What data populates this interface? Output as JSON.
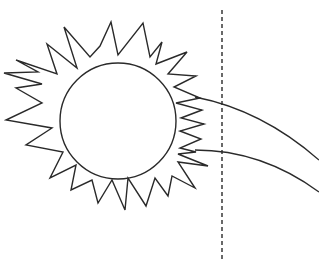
{
  "diagram": {
    "stroke_color": "#2a2a2a",
    "background_color": "#ffffff",
    "sun": {
      "core_circle": {
        "cx": 118,
        "cy": 121,
        "r": 58
      },
      "rays_polygon": "16,60 57,74 47,44 77,68 64,27 90,57 100,46 111,22 118,55 143,23 150,57 162,42 156,64 187,52 168,74 196,76 174,87 200,98 176,103 202,110 181,118 204,124 180,131 201,139 180,148 196,152 178,154 208,166 178,162 195,188 172,176 168,196 155,178 146,206 128,178 125,210 112,180 98,203 92,180 71,190 76,165 50,178 63,152 26,145 52,128 6,120 42,103 16,88 42,84 4,73 38,72"
    },
    "curves": [
      {
        "name": "upper-ray-curve",
        "path": "M 195 97 Q 262 110 319 160"
      },
      {
        "name": "lower-ray-curve",
        "path": "M 195 150 Q 262 150 319 192"
      }
    ],
    "dashed_line": {
      "x": 222,
      "y1": 10,
      "y2": 260,
      "dash": "4,3"
    }
  }
}
